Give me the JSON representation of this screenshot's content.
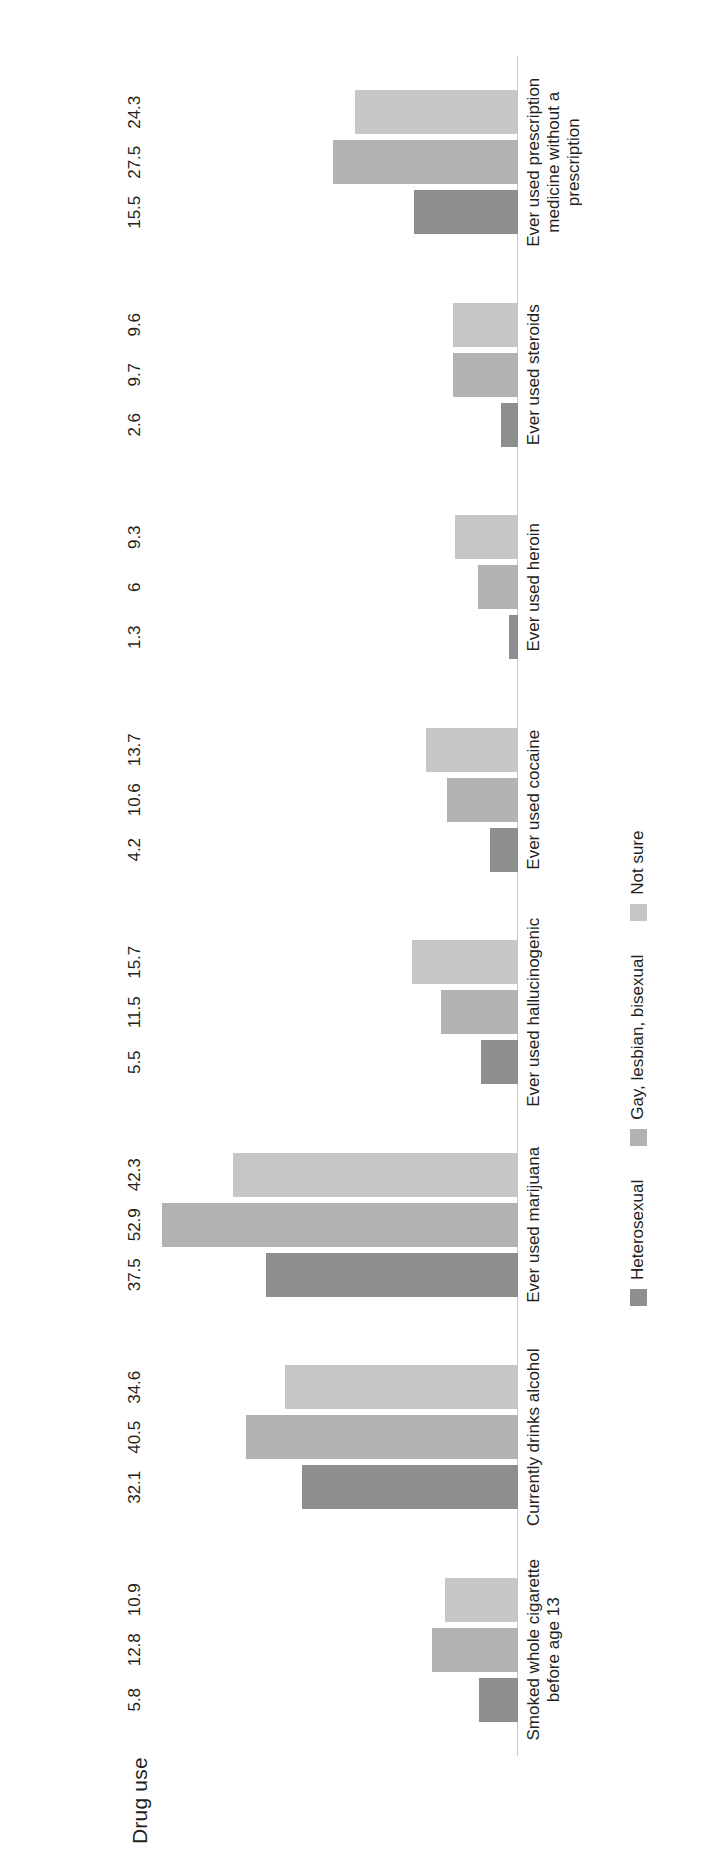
{
  "chart_data": {
    "type": "bar",
    "title": "Drug use",
    "xlabel": "",
    "ylabel": "",
    "ylim": [
      0,
      55
    ],
    "grid": false,
    "orientation": "vertical-rotated-90ccw",
    "legend_position": "bottom",
    "categories": [
      "Smoked whole cigarette before age 13",
      "Currently drinks alcohol",
      "Ever used marijuana",
      "Ever used hallucinogenic",
      "Ever used cocaine",
      "Ever used heroin",
      "Ever used steroids",
      "Ever used prescription medicine without a prescription"
    ],
    "series": [
      {
        "name": "Heterosexual",
        "color": "#8e8e8e",
        "values": [
          5.8,
          32.1,
          37.5,
          5.5,
          4.2,
          1.3,
          2.6,
          15.5
        ],
        "labels": [
          "5.8",
          "32.1",
          "37.5",
          "5.5",
          "4.2",
          "1.3",
          "2.6",
          "15.5"
        ]
      },
      {
        "name": "Gay, lesbian, bisexual",
        "color": "#b2b2b2",
        "values": [
          12.8,
          40.5,
          52.9,
          11.5,
          10.6,
          6,
          9.7,
          27.5
        ],
        "labels": [
          "12.8",
          "40.5",
          "52.9",
          "11.5",
          "10.6",
          "6",
          "9.7",
          "27.5"
        ]
      },
      {
        "name": "Not sure",
        "color": "#c6c6c6",
        "values": [
          10.9,
          34.6,
          42.3,
          15.7,
          13.7,
          9.3,
          9.6,
          24.3
        ],
        "labels": [
          "10.9",
          "34.6",
          "42.3",
          "15.7",
          "13.7",
          "9.3",
          "9.6",
          "24.3"
        ]
      }
    ]
  },
  "legend": {
    "items": [
      {
        "label": "Heterosexual"
      },
      {
        "label": "Gay, lesbian, bisexual"
      },
      {
        "label": "Not sure"
      }
    ]
  }
}
